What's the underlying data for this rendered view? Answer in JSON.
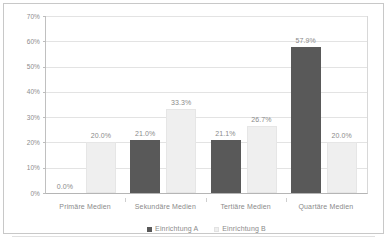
{
  "chart_data": {
    "type": "bar",
    "title": "",
    "subtitle": "",
    "xlabel": "",
    "ylabel": "",
    "ylim": [
      0,
      70
    ],
    "ytick_labels": [
      "70%",
      "60%",
      "50%",
      "40%",
      "30%",
      "20%",
      "10%",
      "0%"
    ],
    "ytick_values": [
      70,
      60,
      50,
      40,
      30,
      20,
      10,
      0
    ],
    "grid": true,
    "legend_position": "bottom",
    "categories": [
      "Primäre Medien",
      "Sekundäre Medien",
      "Tertiäre Medien",
      "Quartäre Medien"
    ],
    "series": [
      {
        "name": "Einrichtung A",
        "color": "#595959",
        "values": [
          0.0,
          21.0,
          21.1,
          57.9
        ],
        "labels": [
          "0.0%",
          "21.0%",
          "21.1%",
          "57.9%"
        ]
      },
      {
        "name": "Einrichtung B",
        "color": "#efefef",
        "values": [
          20.0,
          33.3,
          26.7,
          20.0
        ],
        "labels": [
          "20.0%",
          "33.3%",
          "26.7%",
          "20.0%"
        ]
      }
    ]
  },
  "colors": {
    "series_a": "#595959",
    "series_b": "#efefef",
    "gridline": "#e3e3e3",
    "text": "#8a8a8a",
    "frame": "#c8c8c8"
  }
}
